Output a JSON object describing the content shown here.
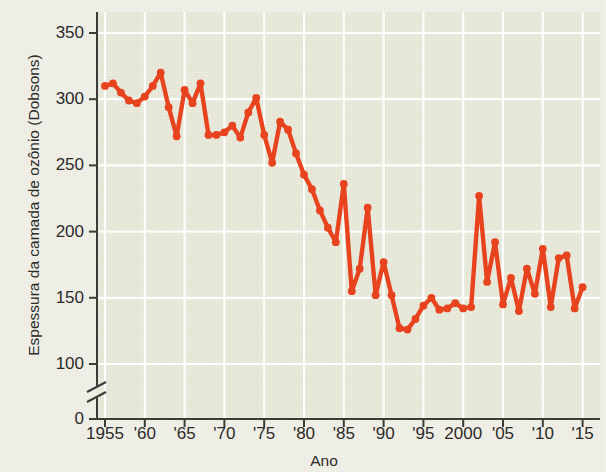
{
  "figure": {
    "background_color": "#f3f2eb",
    "plot_background_color": "#e4e5d4",
    "gridline_color": "#ffffff",
    "axis_color": "#3b3b38",
    "series_color": "#e8431f"
  },
  "chart_data": {
    "type": "line",
    "title": "",
    "subtitle": "",
    "xlabel": "Ano",
    "ylabel": "Espessura da camada de ozônio (Dobsons)",
    "xlim": [
      1955,
      2016
    ],
    "ylim": [
      100,
      365
    ],
    "y_axis_break": {
      "present": true,
      "from": 0,
      "to": 100
    },
    "grid": true,
    "legend": null,
    "x_tick_labels": [
      "1955",
      "'60",
      "'65",
      "'70",
      "'75",
      "'80",
      "'85",
      "'90",
      "'95",
      "2000",
      "'05",
      "'10",
      "'15"
    ],
    "x_tick_values": [
      1955,
      1960,
      1965,
      1970,
      1975,
      1980,
      1985,
      1990,
      1995,
      2000,
      2005,
      2010,
      2015
    ],
    "y_tick_labels": [
      "0",
      "100",
      "150",
      "200",
      "250",
      "300",
      "350"
    ],
    "y_tick_values": [
      0,
      100,
      150,
      200,
      250,
      300,
      350
    ],
    "marker": "circle",
    "x": [
      1955,
      1956,
      1957,
      1958,
      1959,
      1960,
      1961,
      1962,
      1963,
      1964,
      1965,
      1966,
      1967,
      1968,
      1969,
      1970,
      1971,
      1972,
      1973,
      1974,
      1975,
      1976,
      1977,
      1978,
      1979,
      1980,
      1981,
      1982,
      1983,
      1984,
      1985,
      1986,
      1987,
      1988,
      1989,
      1990,
      1991,
      1992,
      1993,
      1994,
      1995,
      1996,
      1997,
      1998,
      1999,
      2000,
      2001,
      2002,
      2003,
      2004,
      2005,
      2006,
      2007,
      2008,
      2009,
      2010,
      2011,
      2012,
      2013,
      2014,
      2015
    ],
    "values": [
      310,
      312,
      305,
      299,
      297,
      302,
      310,
      320,
      294,
      272,
      307,
      297,
      312,
      273,
      273,
      275,
      280,
      271,
      290,
      301,
      273,
      252,
      283,
      277,
      259,
      243,
      232,
      216,
      203,
      192,
      236,
      155,
      172,
      218,
      152,
      177,
      152,
      127,
      126,
      134,
      144,
      150,
      141,
      142,
      146,
      142,
      143,
      227,
      162,
      192,
      145,
      165,
      140,
      172,
      153,
      187,
      143,
      180,
      182,
      142,
      158
    ]
  }
}
